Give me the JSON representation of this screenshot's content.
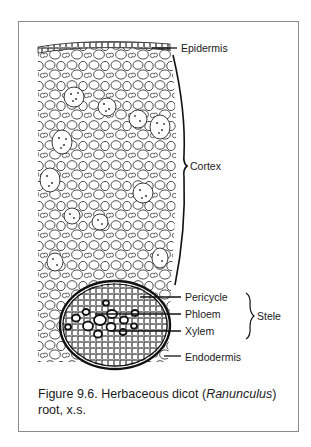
{
  "figure": {
    "labels": {
      "epidermis": "Epidermis",
      "cortex": "Cortex",
      "pericycle": "Pericycle",
      "phloem": "Phloem",
      "xylem": "Xylem",
      "endodermis": "Endodermis",
      "stele": "Stele"
    },
    "caption": {
      "prefix": "Figure 9.6. Herbaceous dicot (",
      "italic": "Ranunculus",
      "suffix": ")",
      "line2": "root, x.s."
    }
  },
  "colors": {
    "ink": "#1a1a1a",
    "frame": "#8a8a8a",
    "background": "#ffffff"
  }
}
